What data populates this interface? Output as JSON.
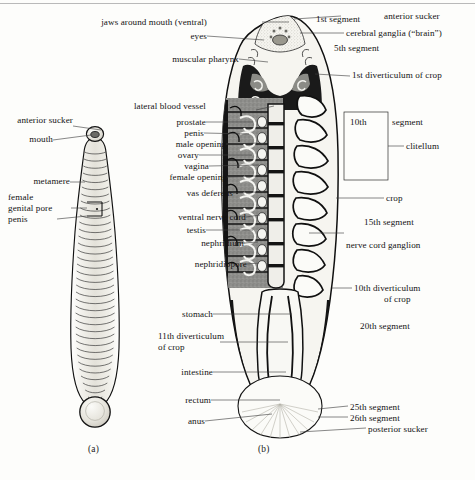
{
  "figure": {
    "panels": [
      {
        "id": "a",
        "caption": "(a)",
        "description": "external dorsal view of segmented leech body"
      },
      {
        "id": "b",
        "caption": "(b)",
        "description": "internal anatomy, ventral dissection"
      }
    ]
  },
  "panel_a": {
    "caption": "(a)",
    "labels": [
      {
        "name": "anterior-sucker",
        "text": "anterior sucker"
      },
      {
        "name": "mouth",
        "text": "mouth"
      },
      {
        "name": "metamere",
        "text": "metamere"
      },
      {
        "name": "female",
        "text": "female"
      },
      {
        "name": "genital-pore",
        "text": "genital pore"
      },
      {
        "name": "penis",
        "text": "penis"
      }
    ]
  },
  "panel_b": {
    "caption": "(b)",
    "labels_left": [
      {
        "name": "jaws-around-mouth",
        "text": "jaws around mouth (ventral)"
      },
      {
        "name": "eyes",
        "text": "eyes"
      },
      {
        "name": "muscular-pharynx",
        "text": "muscular pharynx"
      },
      {
        "name": "lateral-blood-vessel",
        "text": "lateral blood vessel"
      },
      {
        "name": "prostate",
        "text": "prostate"
      },
      {
        "name": "penis",
        "text": "penis"
      },
      {
        "name": "male-opening",
        "text": "male opening"
      },
      {
        "name": "ovary",
        "text": "ovary"
      },
      {
        "name": "vagina",
        "text": "vagina"
      },
      {
        "name": "female-opening",
        "text": "female opening"
      },
      {
        "name": "vas-deferens",
        "text": "vas deferens"
      },
      {
        "name": "ventral-nerve-cord",
        "text": "ventral nerve cord"
      },
      {
        "name": "testis",
        "text": "testis"
      },
      {
        "name": "nephridium",
        "text": "nephridium"
      },
      {
        "name": "nephridiopore",
        "text": "nephridiopore"
      },
      {
        "name": "stomach",
        "text": "stomach"
      },
      {
        "name": "eleventh-diverticulum-line1",
        "text": "11th diverticulum"
      },
      {
        "name": "eleventh-diverticulum-line2",
        "text": "of crop"
      },
      {
        "name": "intestine",
        "text": "intestine"
      },
      {
        "name": "rectum",
        "text": "rectum"
      },
      {
        "name": "anus",
        "text": "anus"
      }
    ],
    "labels_right": [
      {
        "name": "first-segment",
        "text": "1st segment"
      },
      {
        "name": "anterior-sucker",
        "text": "anterior sucker"
      },
      {
        "name": "cerebral-ganglia",
        "text": "cerebral ganglia (“brain”)"
      },
      {
        "name": "fifth-segment",
        "text": "5th segment"
      },
      {
        "name": "first-diverticulum-of-crop",
        "text": "1st diverticulum of crop"
      },
      {
        "name": "tenth-segment",
        "text": "10th"
      },
      {
        "name": "segment-word",
        "text": "segment"
      },
      {
        "name": "clitellum",
        "text": "clitellum"
      },
      {
        "name": "crop",
        "text": "crop"
      },
      {
        "name": "fifteenth-segment",
        "text": "15th segment"
      },
      {
        "name": "nerve-cord-ganglion",
        "text": "nerve cord ganglion"
      },
      {
        "name": "tenth-diverticulum-line1",
        "text": "10th diverticulum"
      },
      {
        "name": "tenth-diverticulum-line2",
        "text": "of crop"
      },
      {
        "name": "twentieth-segment",
        "text": "20th segment"
      },
      {
        "name": "twentyfifth-segment",
        "text": "25th segment"
      },
      {
        "name": "twentysixth-segment",
        "text": "26th segment"
      },
      {
        "name": "posterior-sucker",
        "text": "posterior sucker"
      }
    ]
  },
  "colors": {
    "page_background": "#fdfdfb",
    "ink": "#121212",
    "leader_line": "#4a4a4a",
    "clitellum_fill": "#8d8d8d",
    "body_fill": "#f4f3ef",
    "dark_outline": "#101010",
    "top_rule": "#b9b9b9"
  }
}
